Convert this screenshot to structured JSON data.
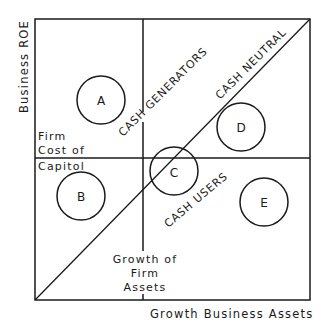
{
  "diagram": {
    "axes": {
      "y_label": "Business ROE",
      "x_label": "Growth Business Assets"
    },
    "reference_lines": {
      "horizontal_label_lines": [
        "Firm",
        "Cost of",
        "Capitol"
      ],
      "vertical_label_lines": [
        "Growth of",
        "Firm",
        "Assets"
      ]
    },
    "regions": {
      "cash_generators": "CASH GENERATORS",
      "cash_neutral": "CASH NEUTRAL",
      "cash_users": "CASH USERS"
    },
    "businesses": [
      {
        "label": "A"
      },
      {
        "label": "B"
      },
      {
        "label": "C"
      },
      {
        "label": "D"
      },
      {
        "label": "E"
      }
    ],
    "colors": {
      "ink": "#1a1a1a",
      "background": "#ffffff"
    }
  }
}
